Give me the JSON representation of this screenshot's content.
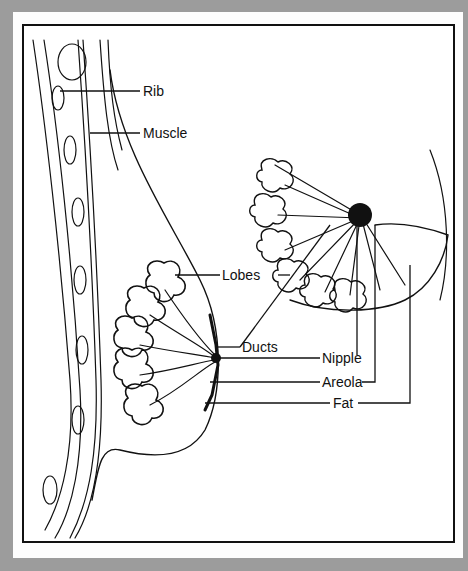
{
  "diagram": {
    "title": "",
    "labels": {
      "rib": "Rib",
      "muscle": "Muscle",
      "lobes": "Lobes",
      "ducts": "Ducts",
      "nipple": "Nipple",
      "areola": "Areola",
      "fat": "Fat"
    },
    "colors": {
      "background": "#9c9c9c",
      "card": "#fdfdfd",
      "ink": "#111111"
    }
  }
}
